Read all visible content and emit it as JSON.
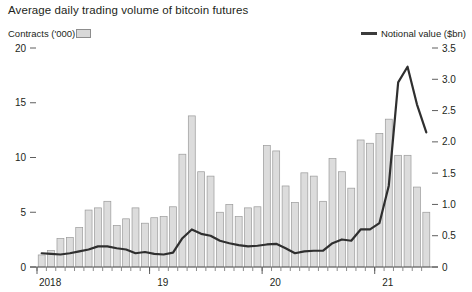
{
  "chart_data": {
    "type": "bar",
    "title": "Average daily trading volume of bitcoin futures",
    "xlabel": "",
    "ylabel": "Contracts ('000)",
    "y2label": "Notional value ($bn)",
    "ylim": [
      0,
      20
    ],
    "y2lim": [
      0,
      3.5
    ],
    "yticks": [
      "0",
      "5",
      "10",
      "15",
      "20"
    ],
    "ytick_values": [
      0,
      5,
      10,
      15,
      20
    ],
    "y2ticks": [
      "0",
      "0.5",
      "1.0",
      "1.5",
      "2.0",
      "2.5",
      "3.0",
      "3.5"
    ],
    "y2tick_values": [
      0,
      0.5,
      1.0,
      1.5,
      2.0,
      2.5,
      3.0,
      3.5
    ],
    "xticks": [
      "2018",
      "19",
      "20",
      "21"
    ],
    "xtick_values": [
      0,
      12,
      24,
      36
    ],
    "grid": false,
    "legend_position": "top",
    "categories": [
      "2018-01",
      "2018-02",
      "2018-03",
      "2018-04",
      "2018-05",
      "2018-06",
      "2018-07",
      "2018-08",
      "2018-09",
      "2018-10",
      "2018-11",
      "2018-12",
      "2019-01",
      "2019-02",
      "2019-03",
      "2019-04",
      "2019-05",
      "2019-06",
      "2019-07",
      "2019-08",
      "2019-09",
      "2019-10",
      "2019-11",
      "2019-12",
      "2020-01",
      "2020-02",
      "2020-03",
      "2020-04",
      "2020-05",
      "2020-06",
      "2020-07",
      "2020-08",
      "2020-09",
      "2020-10",
      "2020-11",
      "2020-12",
      "2021-01",
      "2021-02",
      "2021-03",
      "2021-04",
      "2021-05",
      "2021-06"
    ],
    "series": [
      {
        "name": "Contracts ('000)",
        "type": "bar",
        "axis": "left",
        "color": "#dcdcdc",
        "values": [
          1.1,
          1.5,
          2.6,
          2.7,
          3.6,
          5.2,
          5.4,
          6.0,
          3.8,
          4.4,
          5.4,
          4.0,
          4.5,
          4.6,
          5.5,
          10.3,
          13.8,
          8.7,
          8.3,
          5.0,
          5.7,
          4.6,
          5.4,
          5.5,
          11.1,
          10.6,
          7.4,
          5.9,
          8.6,
          8.3,
          6.0,
          9.9,
          8.7,
          7.2,
          11.6,
          11.3,
          12.2,
          13.5,
          10.2,
          10.2,
          7.3,
          5.0
        ]
      },
      {
        "name": "Notional value ($bn)",
        "type": "line",
        "axis": "right",
        "color": "#2f2f2f",
        "values": [
          0.22,
          0.21,
          0.2,
          0.22,
          0.25,
          0.28,
          0.33,
          0.33,
          0.3,
          0.28,
          0.22,
          0.24,
          0.21,
          0.2,
          0.23,
          0.46,
          0.6,
          0.53,
          0.5,
          0.42,
          0.38,
          0.35,
          0.33,
          0.34,
          0.36,
          0.37,
          0.3,
          0.22,
          0.25,
          0.26,
          0.26,
          0.38,
          0.44,
          0.42,
          0.6,
          0.6,
          0.7,
          1.3,
          2.95,
          3.2,
          2.6,
          2.15
        ]
      }
    ]
  },
  "legend": {
    "left_label": "Contracts ('000)",
    "right_label": "Notional value ($bn)"
  }
}
